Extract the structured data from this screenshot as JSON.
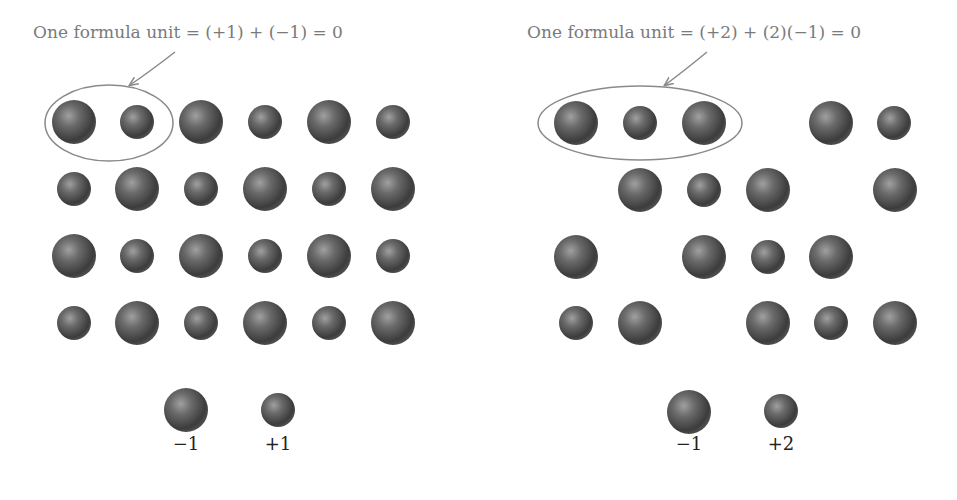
{
  "panels": [
    {
      "id": "left",
      "caption": "One formula unit = (+1) + (−1) = 0",
      "caption_pos": [
        188,
        38
      ],
      "arrow": {
        "from": [
          175,
          52
        ],
        "to": [
          130,
          85
        ]
      },
      "ellipse": {
        "cx": 109,
        "cy": 123,
        "rx": 64,
        "ry": 38
      },
      "ions": [
        {
          "x": 74,
          "y": 122,
          "size": "large"
        },
        {
          "x": 137,
          "y": 122,
          "size": "small"
        },
        {
          "x": 201,
          "y": 122,
          "size": "large"
        },
        {
          "x": 265,
          "y": 122,
          "size": "small"
        },
        {
          "x": 329,
          "y": 122,
          "size": "large"
        },
        {
          "x": 393,
          "y": 122,
          "size": "small"
        },
        {
          "x": 74,
          "y": 189,
          "size": "small"
        },
        {
          "x": 137,
          "y": 189,
          "size": "large"
        },
        {
          "x": 201,
          "y": 189,
          "size": "small"
        },
        {
          "x": 265,
          "y": 189,
          "size": "large"
        },
        {
          "x": 329,
          "y": 189,
          "size": "small"
        },
        {
          "x": 393,
          "y": 189,
          "size": "large"
        },
        {
          "x": 74,
          "y": 256,
          "size": "large"
        },
        {
          "x": 137,
          "y": 256,
          "size": "small"
        },
        {
          "x": 201,
          "y": 256,
          "size": "large"
        },
        {
          "x": 265,
          "y": 256,
          "size": "small"
        },
        {
          "x": 329,
          "y": 256,
          "size": "large"
        },
        {
          "x": 393,
          "y": 256,
          "size": "small"
        },
        {
          "x": 74,
          "y": 323,
          "size": "small"
        },
        {
          "x": 137,
          "y": 323,
          "size": "large"
        },
        {
          "x": 201,
          "y": 323,
          "size": "small"
        },
        {
          "x": 265,
          "y": 323,
          "size": "large"
        },
        {
          "x": 329,
          "y": 323,
          "size": "small"
        },
        {
          "x": 393,
          "y": 323,
          "size": "large"
        }
      ],
      "legend": [
        {
          "x": 186,
          "y": 410,
          "size": "large",
          "label": "−1"
        },
        {
          "x": 278,
          "y": 410,
          "size": "small",
          "label": "+1"
        }
      ]
    },
    {
      "id": "right",
      "caption": "One formula unit = (+2) + (2)(−1) = 0",
      "caption_pos": [
        694,
        38
      ],
      "arrow": {
        "from": [
          707,
          52
        ],
        "to": [
          665,
          85
        ]
      },
      "ellipse": {
        "cx": 640,
        "cy": 123,
        "rx": 102,
        "ry": 37
      },
      "ions": [
        {
          "x": 576,
          "y": 123,
          "size": "large"
        },
        {
          "x": 640,
          "y": 123,
          "size": "small"
        },
        {
          "x": 704,
          "y": 123,
          "size": "large"
        },
        {
          "x": 831,
          "y": 123,
          "size": "large"
        },
        {
          "x": 894,
          "y": 123,
          "size": "small"
        },
        {
          "x": 640,
          "y": 190,
          "size": "large"
        },
        {
          "x": 704,
          "y": 190,
          "size": "small"
        },
        {
          "x": 768,
          "y": 190,
          "size": "large"
        },
        {
          "x": 895,
          "y": 190,
          "size": "large"
        },
        {
          "x": 576,
          "y": 257,
          "size": "large"
        },
        {
          "x": 704,
          "y": 257,
          "size": "large"
        },
        {
          "x": 768,
          "y": 257,
          "size": "small"
        },
        {
          "x": 831,
          "y": 257,
          "size": "large"
        },
        {
          "x": 576,
          "y": 323,
          "size": "small"
        },
        {
          "x": 640,
          "y": 323,
          "size": "large"
        },
        {
          "x": 768,
          "y": 323,
          "size": "large"
        },
        {
          "x": 831,
          "y": 323,
          "size": "small"
        },
        {
          "x": 895,
          "y": 323,
          "size": "large"
        }
      ],
      "legend": [
        {
          "x": 689,
          "y": 412,
          "size": "large",
          "label": "−1"
        },
        {
          "x": 781,
          "y": 411,
          "size": "small",
          "label": "+2"
        }
      ]
    }
  ],
  "radii": {
    "large": 22,
    "small": 17
  },
  "colors": {
    "ion_dark": "#3a3a3a",
    "ion_mid": "#6e6e6e",
    "ion_highlight": "#9a9a9a",
    "ellipse": "#8a8a8a",
    "caption": "#7a7a7a",
    "label": "#222222"
  }
}
